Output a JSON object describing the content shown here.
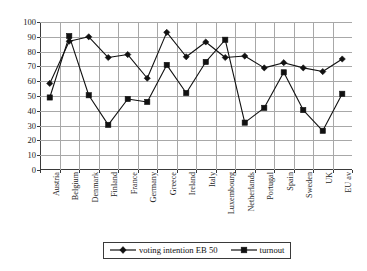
{
  "chart_data": {
    "type": "line",
    "title": "",
    "subtitle": "",
    "xlabel": "",
    "ylabel": "",
    "ylim": [
      0,
      100
    ],
    "yticks": [
      0,
      10,
      20,
      30,
      40,
      50,
      60,
      70,
      80,
      90,
      100
    ],
    "grid": true,
    "legend_position": "bottom",
    "categories": [
      "Austria",
      "Belgium",
      "Denmark",
      "Finland",
      "France",
      "Germany",
      "Greece",
      "Ireland",
      "Italy",
      "Luxembourg",
      "Netherlands",
      "Portugal",
      "Spain",
      "Sweden",
      "UK",
      "EU av"
    ],
    "series": [
      {
        "name": "voting intention EB 50",
        "marker": "diamond",
        "color": "#111111",
        "values": [
          58.5,
          87,
          90,
          76,
          78,
          62,
          93,
          76.5,
          86.5,
          76,
          77,
          69,
          72.5,
          69,
          66.5,
          75
        ]
      },
      {
        "name": "turnout",
        "marker": "square",
        "color": "#111111",
        "values": [
          49,
          90.5,
          50.5,
          30.5,
          48,
          46,
          71,
          52,
          73,
          88,
          32,
          42,
          66,
          40.5,
          26.5,
          51.5
        ]
      }
    ]
  },
  "legend": {
    "entries": [
      {
        "label": "voting intention EB 50"
      },
      {
        "label": "turnout"
      }
    ]
  }
}
